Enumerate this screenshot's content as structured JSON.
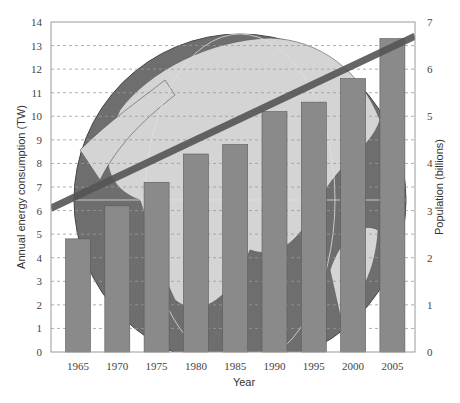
{
  "chart_data": {
    "type": "bar",
    "title": "",
    "xlabel": "Year",
    "ylabel": "Annual energy consumption (TW)",
    "y2label": "Population (billions)",
    "categories": [
      "1965",
      "1970",
      "1975",
      "1980",
      "1985",
      "1990",
      "1995",
      "2000",
      "2005"
    ],
    "series": [
      {
        "name": "Annual energy consumption (TW)",
        "type": "bar",
        "axis": "left",
        "values": [
          4.8,
          6.2,
          7.2,
          8.4,
          8.8,
          10.2,
          10.6,
          11.6,
          13.3
        ]
      },
      {
        "name": "Population (billions)",
        "type": "line",
        "axis": "right",
        "x_range": [
          "start",
          "end"
        ],
        "values_at_ends": [
          3.05,
          6.7
        ]
      }
    ],
    "ylim": [
      0,
      14
    ],
    "y2lim": [
      0,
      7
    ],
    "yticks": [
      "0",
      "1",
      "2",
      "3",
      "4",
      "5",
      "6",
      "7",
      "8",
      "9",
      "10",
      "11",
      "12",
      "13",
      "14"
    ],
    "y2ticks": [
      "0",
      "1",
      "2",
      "3",
      "4",
      "5",
      "6",
      "7"
    ],
    "grid": "horizontal dashed",
    "background": "globe image",
    "legend": "none",
    "colors": {
      "bar_fill": "#8a8a8a",
      "bar_stroke": "#5a5a5a",
      "line": "#555555",
      "grid": "#9a9a9a",
      "globe_ocean": "#6e6e6e",
      "globe_land": "#d4d4d4"
    }
  }
}
